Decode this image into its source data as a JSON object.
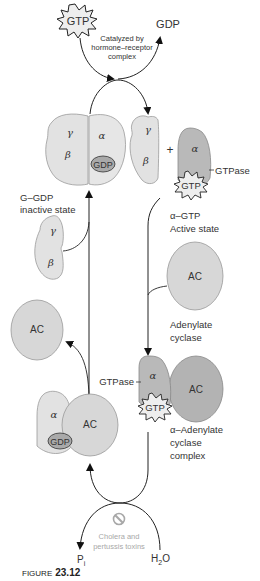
{
  "figure": {
    "caption_prefix": "FIGURE",
    "caption_number": "23.12"
  },
  "top_cycle": {
    "gtp_label": "GTP",
    "gdp_label": "GDP",
    "catalyst_line1": "Catalyzed by",
    "catalyst_line2": "hormone–receptor",
    "catalyst_line3": "complex"
  },
  "inactive_complex": {
    "gamma": "γ",
    "beta": "β",
    "alpha": "α",
    "gdp_label": "GDP",
    "state_line1": "G–GDP",
    "state_line2": "inactive state"
  },
  "free_beta_gamma": {
    "gamma": "γ",
    "beta": "β",
    "plus": "+"
  },
  "active_alpha": {
    "alpha": "α",
    "gtp_label": "GTP",
    "gtpase_label": "GTPase",
    "state_line1": "α–GTP",
    "state_line2": "Active state"
  },
  "released_beta_gamma": {
    "gamma": "γ",
    "beta": "β"
  },
  "adenylate_cyclase": {
    "ac_label": "AC",
    "name_line1": "Adenylate",
    "name_line2": "cyclase"
  },
  "released_ac": {
    "ac_label": "AC"
  },
  "alpha_ac_complex": {
    "alpha": "α",
    "ac_label": "AC",
    "gtp_label": "GTP",
    "gtpase_label": "GTPase",
    "name_line1": "α–Adenylate",
    "name_line2": "cyclase",
    "name_line3": "complex"
  },
  "alpha_gdp_ac": {
    "alpha": "α",
    "ac_label": "AC",
    "gdp_label": "GDP"
  },
  "bottom_cycle": {
    "toxin_line1": "Cholera and",
    "toxin_line2": "pertussis toxins",
    "pi_label": "P",
    "pi_sub": "i",
    "h2o_h": "H",
    "h2o_sub": "2",
    "h2o_o": "O"
  },
  "colors": {
    "light_subunit": "#e2e2e2",
    "alpha_dark": "#b9b9b9",
    "ac_light": "#d7d7d7",
    "ac_dark": "#b3b3b3",
    "gdp_oval": "#a9a9a9",
    "gtp_star": "#eeeeee",
    "caption_red": "#c0392b"
  }
}
